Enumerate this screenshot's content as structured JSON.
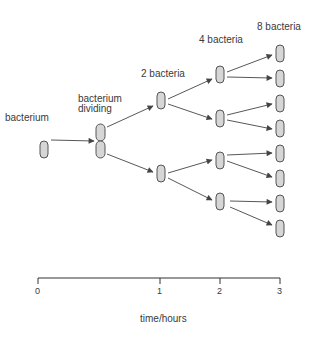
{
  "colors": {
    "cell_fill": "#d6d6d6",
    "cell_stroke": "#555555",
    "arrow": "#444444",
    "text": "#3a3a3a"
  },
  "labels": [
    {
      "id": "bacterium",
      "text": "bacterium",
      "x": 5,
      "y": 112
    },
    {
      "id": "bacterium-dividing-1",
      "text": "bacterium",
      "x": 78,
      "y": 93
    },
    {
      "id": "bacterium-dividing-2",
      "text": "dividing",
      "x": 78,
      "y": 103
    },
    {
      "id": "2-bacteria",
      "text": "2 bacteria",
      "x": 141,
      "y": 68
    },
    {
      "id": "4-bacteria",
      "text": "4 bacteria",
      "x": 199,
      "y": 34
    },
    {
      "id": "8 bacteria",
      "text": "8 bacteria",
      "x": 257,
      "y": 21
    }
  ],
  "cells": [
    {
      "id": "g0",
      "x": 40,
      "y": 141,
      "w": 8,
      "h": 17
    },
    {
      "id": "div-top",
      "x": 96,
      "y": 124,
      "w": 9,
      "h": 17
    },
    {
      "id": "div-bot",
      "x": 96,
      "y": 141,
      "w": 9,
      "h": 17
    },
    {
      "id": "g1a",
      "x": 157,
      "y": 92,
      "w": 8,
      "h": 17
    },
    {
      "id": "g1b",
      "x": 157,
      "y": 165,
      "w": 8,
      "h": 17
    },
    {
      "id": "g2a",
      "x": 216,
      "y": 66,
      "w": 8,
      "h": 17
    },
    {
      "id": "g2b",
      "x": 216,
      "y": 110,
      "w": 8,
      "h": 17
    },
    {
      "id": "g2c",
      "x": 216,
      "y": 152,
      "w": 8,
      "h": 17
    },
    {
      "id": "g2d",
      "x": 216,
      "y": 193,
      "w": 8,
      "h": 17
    },
    {
      "id": "g3a",
      "x": 276,
      "y": 45,
      "w": 8,
      "h": 17
    },
    {
      "id": "g3b",
      "x": 276,
      "y": 70,
      "w": 8,
      "h": 17
    },
    {
      "id": "g3c",
      "x": 276,
      "y": 95,
      "w": 8,
      "h": 17
    },
    {
      "id": "g3d",
      "x": 276,
      "y": 120,
      "w": 8,
      "h": 17
    },
    {
      "id": "g3e",
      "x": 276,
      "y": 145,
      "w": 8,
      "h": 17
    },
    {
      "id": "g3f",
      "x": 276,
      "y": 170,
      "w": 8,
      "h": 17
    },
    {
      "id": "g3g",
      "x": 276,
      "y": 195,
      "w": 8,
      "h": 17
    },
    {
      "id": "g3h",
      "x": 276,
      "y": 220,
      "w": 8,
      "h": 17
    }
  ],
  "arrows": [
    {
      "x1": 51,
      "y1": 140,
      "x2": 94,
      "y2": 141
    },
    {
      "x1": 107,
      "y1": 127,
      "x2": 153,
      "y2": 106
    },
    {
      "x1": 107,
      "y1": 154,
      "x2": 153,
      "y2": 172
    },
    {
      "x1": 168,
      "y1": 99,
      "x2": 212,
      "y2": 79
    },
    {
      "x1": 168,
      "y1": 104,
      "x2": 212,
      "y2": 119
    },
    {
      "x1": 168,
      "y1": 173,
      "x2": 212,
      "y2": 160
    },
    {
      "x1": 168,
      "y1": 178,
      "x2": 212,
      "y2": 200
    },
    {
      "x1": 227,
      "y1": 72,
      "x2": 272,
      "y2": 55
    },
    {
      "x1": 227,
      "y1": 77,
      "x2": 272,
      "y2": 78
    },
    {
      "x1": 227,
      "y1": 115,
      "x2": 272,
      "y2": 104
    },
    {
      "x1": 227,
      "y1": 120,
      "x2": 272,
      "y2": 129
    },
    {
      "x1": 227,
      "y1": 155,
      "x2": 272,
      "y2": 153
    },
    {
      "x1": 227,
      "y1": 161,
      "x2": 272,
      "y2": 177
    },
    {
      "x1": 230,
      "y1": 201,
      "x2": 272,
      "y2": 202
    },
    {
      "x1": 230,
      "y1": 207,
      "x2": 272,
      "y2": 225
    }
  ],
  "axis": {
    "y": 278,
    "x_start": 38,
    "x_end": 280,
    "ticks": [
      {
        "label": "0",
        "x": 38
      },
      {
        "label": "1",
        "x": 160
      },
      {
        "label": "2",
        "x": 220
      },
      {
        "label": "3",
        "x": 280
      }
    ],
    "title": "time/hours",
    "title_x": 140,
    "title_y": 313
  }
}
